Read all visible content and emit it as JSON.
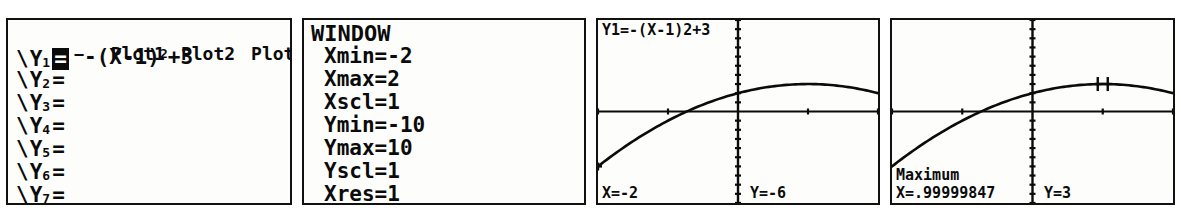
{
  "screen": {
    "device": "TI graphing calculator",
    "background_color": "#ffffff",
    "lcd_color": "#fdfdfb",
    "ink_color": "#0b0b0b",
    "panel_count": 4
  },
  "panels": {
    "y_editor": {
      "title": "Y= editor",
      "plot_tabs": [
        "Plot1",
        "Plot2",
        "Plot3"
      ],
      "rows": [
        {
          "slash": "\\",
          "name": "Y",
          "index": "1",
          "equals": "=",
          "selected": true,
          "expression_prefix": "-(X-1)",
          "expression_exponent": "2",
          "expression_suffix": "+3",
          "expression": "-(X-1)²+3"
        },
        {
          "slash": "\\",
          "name": "Y",
          "index": "2",
          "equals": "=",
          "selected": false,
          "expression": ""
        },
        {
          "slash": "\\",
          "name": "Y",
          "index": "3",
          "equals": "=",
          "selected": false,
          "expression": ""
        },
        {
          "slash": "\\",
          "name": "Y",
          "index": "4",
          "equals": "=",
          "selected": false,
          "expression": ""
        },
        {
          "slash": "\\",
          "name": "Y",
          "index": "5",
          "equals": "=",
          "selected": false,
          "expression": ""
        },
        {
          "slash": "\\",
          "name": "Y",
          "index": "6",
          "equals": "=",
          "selected": false,
          "expression": ""
        },
        {
          "slash": "\\",
          "name": "Y",
          "index": "7",
          "equals": "=",
          "selected": false,
          "expression": ""
        }
      ]
    },
    "window": {
      "title": "WINDOW",
      "settings": [
        {
          "label": "Xmin",
          "value": "-2"
        },
        {
          "label": "Xmax",
          "value": "2"
        },
        {
          "label": "Xscl",
          "value": "1"
        },
        {
          "label": "Ymin",
          "value": "-10"
        },
        {
          "label": "Ymax",
          "value": "10"
        },
        {
          "label": "Yscl",
          "value": "1"
        },
        {
          "label": "Xres",
          "value": "1"
        }
      ]
    },
    "trace": {
      "header": "Y1=-(X-1)2+3",
      "x_readout": "X=-2",
      "y_readout": "Y=-6"
    },
    "maximum": {
      "status": "Maximum",
      "x_readout": "X=.99999847",
      "y_readout": "Y=3"
    }
  },
  "chart_data": [
    {
      "type": "line",
      "title": "Y1=-(X-1)2+3",
      "equation": "y = -(x-1)^2 + 3",
      "xlabel": "X",
      "ylabel": "Y",
      "xlim": [
        -2,
        2
      ],
      "ylim": [
        -10,
        10
      ],
      "xscl": 1,
      "yscl": 1,
      "grid": false,
      "legend": "none",
      "cursor": {
        "label": "trace",
        "x": -2,
        "y": -6
      },
      "x": [
        -2,
        -1.75,
        -1.5,
        -1.25,
        -1,
        -0.75,
        -0.5,
        -0.25,
        0,
        0.25,
        0.5,
        0.75,
        1,
        1.25,
        1.5,
        1.75,
        2
      ],
      "values": [
        -6,
        -4.5625,
        -3.25,
        -2.0625,
        -1,
        -0.0625,
        0.75,
        1.4375,
        2,
        2.4375,
        2.75,
        2.9375,
        3,
        2.9375,
        2.75,
        2.4375,
        2
      ]
    },
    {
      "type": "line",
      "title": "Maximum",
      "equation": "y = -(x-1)^2 + 3",
      "xlabel": "X",
      "ylabel": "Y",
      "xlim": [
        -2,
        2
      ],
      "ylim": [
        -10,
        10
      ],
      "xscl": 1,
      "yscl": 1,
      "grid": false,
      "legend": "none",
      "cursor": {
        "label": "maximum",
        "x": 0.99999847,
        "y": 3
      },
      "x": [
        -2,
        -1.75,
        -1.5,
        -1.25,
        -1,
        -0.75,
        -0.5,
        -0.25,
        0,
        0.25,
        0.5,
        0.75,
        1,
        1.25,
        1.5,
        1.75,
        2
      ],
      "values": [
        -6,
        -4.5625,
        -3.25,
        -2.0625,
        -1,
        -0.0625,
        0.75,
        1.4375,
        2,
        2.4375,
        2.75,
        2.9375,
        3,
        2.9375,
        2.75,
        2.4375,
        2
      ]
    }
  ]
}
